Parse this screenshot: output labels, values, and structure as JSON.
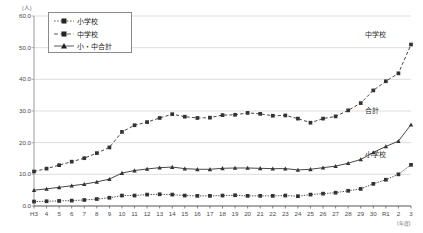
{
  "chart_data": {
    "type": "line",
    "title": "",
    "xlabel": "(年度)",
    "ylabel": "(人)",
    "ylim": [
      0,
      60
    ],
    "yticks": [
      "0.0",
      "10.0",
      "20.0",
      "30.0",
      "40.0",
      "50.0",
      "60.0"
    ],
    "grid": true,
    "legend_position": "top-left inside",
    "categories": [
      "H3",
      "4",
      "5",
      "6",
      "7",
      "8",
      "9",
      "10",
      "11",
      "12",
      "13",
      "14",
      "15",
      "16",
      "17",
      "18",
      "19",
      "20",
      "21",
      "22",
      "23",
      "24",
      "25",
      "26",
      "27",
      "28",
      "29",
      "30",
      "R1",
      "2",
      "3"
    ],
    "series": [
      {
        "name": "小学校",
        "marker": "square",
        "line_style": "dotted",
        "color": "#333333",
        "values": [
          1.4,
          1.5,
          1.6,
          1.7,
          1.9,
          2.2,
          2.6,
          3.3,
          3.3,
          3.6,
          3.7,
          3.6,
          3.3,
          3.2,
          3.2,
          3.3,
          3.4,
          3.2,
          3.2,
          3.2,
          3.3,
          3.1,
          3.6,
          3.9,
          4.2,
          4.8,
          5.4,
          7.0,
          8.3,
          10.0,
          13.0
        ]
      },
      {
        "name": "中学校",
        "marker": "square",
        "line_style": "dashed",
        "color": "#333333",
        "values": [
          10.9,
          11.8,
          12.9,
          14.0,
          15.1,
          16.7,
          18.5,
          23.4,
          25.5,
          26.5,
          27.8,
          29.0,
          28.2,
          27.8,
          27.9,
          28.7,
          28.8,
          29.4,
          29.1,
          28.5,
          28.6,
          27.6,
          26.3,
          27.6,
          28.3,
          30.2,
          32.5,
          36.5,
          39.4,
          41.9,
          51.0
        ]
      },
      {
        "name": "小・中合計",
        "marker": "triangle",
        "line_style": "solid",
        "color": "#333333",
        "values": [
          5.0,
          5.4,
          5.9,
          6.4,
          6.9,
          7.6,
          8.5,
          10.4,
          11.2,
          11.7,
          12.1,
          12.3,
          11.8,
          11.6,
          11.6,
          11.9,
          12.0,
          12.0,
          11.9,
          11.8,
          11.8,
          11.4,
          11.6,
          12.1,
          12.6,
          13.5,
          14.7,
          16.9,
          18.8,
          20.5,
          25.7
        ]
      }
    ],
    "annotations": [
      {
        "text": "中学校",
        "x_pct": 90,
        "y_pct": 7
      },
      {
        "text": "合計",
        "x_pct": 90,
        "y_pct": 47
      },
      {
        "text": "小学校",
        "x_pct": 90,
        "y_pct": 70
      }
    ]
  },
  "legend": {
    "items": [
      {
        "label": "小学校"
      },
      {
        "label": "中学校"
      },
      {
        "label": "小・中合計"
      }
    ]
  },
  "axes": {
    "y_unit": "(人)",
    "x_unit": "(年度)"
  }
}
